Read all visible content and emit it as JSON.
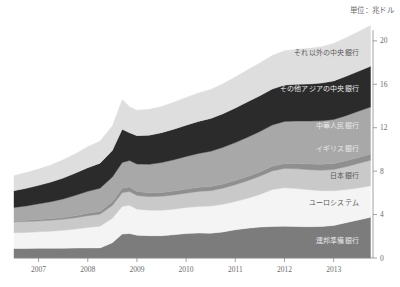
{
  "unit_note": "単位：兆ドル",
  "chart_data": {
    "type": "area",
    "stacked": true,
    "title": "",
    "subtitle": "",
    "xlabel": "",
    "ylabel": "",
    "unit": "単位：兆ドル",
    "xlim": [
      2006.5,
      2013.8
    ],
    "ylim": [
      0,
      21
    ],
    "yticks": [
      0,
      4,
      8,
      12,
      16,
      20
    ],
    "xticks": [
      2007,
      2008,
      2009,
      2010,
      2011,
      2012,
      2013
    ],
    "grid": false,
    "legend_position": "inline-right",
    "x": [
      2006.5,
      2006.75,
      2007.0,
      2007.25,
      2007.5,
      2007.75,
      2008.0,
      2008.25,
      2008.5,
      2008.7,
      2008.85,
      2009.0,
      2009.25,
      2009.5,
      2009.75,
      2010.0,
      2010.25,
      2010.5,
      2010.75,
      2011.0,
      2011.25,
      2011.5,
      2011.75,
      2012.0,
      2012.25,
      2012.5,
      2012.75,
      2013.0,
      2013.25,
      2013.5,
      2013.75
    ],
    "series": [
      {
        "name": "連邦準備銀行",
        "label": "連邦準備銀行",
        "color": "#7c7c7c",
        "label_color": "light",
        "values": [
          0.88,
          0.88,
          0.89,
          0.89,
          0.9,
          0.91,
          0.92,
          0.93,
          1.4,
          2.2,
          2.25,
          2.1,
          2.05,
          2.05,
          2.15,
          2.25,
          2.3,
          2.28,
          2.4,
          2.6,
          2.75,
          2.85,
          2.9,
          2.92,
          2.9,
          2.88,
          2.9,
          3.0,
          3.25,
          3.5,
          3.75
        ]
      },
      {
        "name": "ユーロシステム",
        "label": "ユーロシステム",
        "color": "#f4f4f4",
        "label_color": "mid",
        "values": [
          1.45,
          1.48,
          1.52,
          1.58,
          1.65,
          1.75,
          1.9,
          2.0,
          2.25,
          2.55,
          2.6,
          2.4,
          2.35,
          2.35,
          2.35,
          2.4,
          2.45,
          2.5,
          2.55,
          2.6,
          2.75,
          3.0,
          3.4,
          3.55,
          3.5,
          3.4,
          3.3,
          3.2,
          3.05,
          2.95,
          2.9
        ]
      },
      {
        "name": "日本銀行",
        "label": "日本銀行",
        "color": "#c9c9c9",
        "label_color": "mid",
        "values": [
          1.0,
          1.0,
          1.0,
          1.0,
          1.02,
          1.05,
          1.08,
          1.1,
          1.18,
          1.25,
          1.28,
          1.25,
          1.25,
          1.28,
          1.3,
          1.32,
          1.38,
          1.42,
          1.48,
          1.55,
          1.62,
          1.68,
          1.72,
          1.78,
          1.82,
          1.85,
          1.88,
          1.95,
          2.1,
          2.25,
          2.35
        ]
      },
      {
        "name": "イギリス銀行",
        "label": "イギリス銀行",
        "color": "#8f8f8f",
        "label_color": "light",
        "values": [
          0.12,
          0.12,
          0.13,
          0.14,
          0.15,
          0.18,
          0.22,
          0.25,
          0.35,
          0.42,
          0.4,
          0.38,
          0.36,
          0.36,
          0.37,
          0.38,
          0.38,
          0.38,
          0.38,
          0.38,
          0.39,
          0.4,
          0.42,
          0.45,
          0.48,
          0.52,
          0.55,
          0.56,
          0.56,
          0.56,
          0.56
        ]
      },
      {
        "name": "中華人民銀行",
        "label": "中華人民銀行",
        "color": "#a8a8a8",
        "label_color": "light",
        "values": [
          1.2,
          1.32,
          1.45,
          1.58,
          1.72,
          1.88,
          2.02,
          2.15,
          2.28,
          2.38,
          2.45,
          2.52,
          2.62,
          2.75,
          2.88,
          3.0,
          3.12,
          3.25,
          3.38,
          3.5,
          3.62,
          3.72,
          3.8,
          3.88,
          3.92,
          3.96,
          4.0,
          4.05,
          4.15,
          4.25,
          4.35
        ]
      },
      {
        "name": "その他アジアの中央銀行",
        "label": "その他アジアの中央銀行",
        "color": "#2b2b2b",
        "label_color": "light",
        "values": [
          1.55,
          1.62,
          1.7,
          1.8,
          1.92,
          2.05,
          2.18,
          2.3,
          2.45,
          3.05,
          2.55,
          2.62,
          2.68,
          2.75,
          2.82,
          2.88,
          2.95,
          3.02,
          3.1,
          3.18,
          3.25,
          3.3,
          3.32,
          3.35,
          3.38,
          3.42,
          3.48,
          3.55,
          3.62,
          3.68,
          3.75
        ]
      },
      {
        "name": "それ以外の中央銀行",
        "label": "それ以外の中央銀行",
        "color": "#dedede",
        "label_color": "mid",
        "values": [
          1.4,
          1.45,
          1.5,
          1.58,
          1.68,
          1.78,
          1.92,
          2.05,
          2.25,
          2.75,
          2.4,
          2.35,
          2.38,
          2.42,
          2.48,
          2.55,
          2.62,
          2.68,
          2.75,
          2.85,
          2.95,
          3.02,
          3.08,
          3.15,
          3.22,
          3.28,
          3.35,
          3.45,
          3.55,
          3.65,
          3.75
        ]
      }
    ],
    "labels_placement": [
      {
        "series": "それ以外の中央銀行",
        "x": 359,
        "y": 55
      },
      {
        "series": "その他アジアの中央銀行",
        "x": 359,
        "y": 91
      },
      {
        "series": "中華人民銀行",
        "x": 359,
        "y": 128
      },
      {
        "series": "イギリス銀行",
        "x": 359,
        "y": 151
      },
      {
        "series": "日本銀行",
        "x": 359,
        "y": 178
      },
      {
        "series": "ユーロシステム",
        "x": 359,
        "y": 205
      },
      {
        "series": "連邦準備銀行",
        "x": 359,
        "y": 243
      }
    ]
  }
}
